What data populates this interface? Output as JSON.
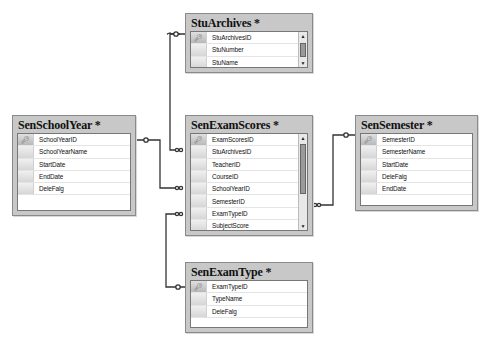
{
  "diagram": {
    "type": "database-relationship-diagram",
    "tables": [
      {
        "name": "StuArchives",
        "title": "StuArchives *",
        "columns": [
          {
            "name": "StuArchivesID",
            "primary_key": true
          },
          {
            "name": "StuNumber",
            "primary_key": false
          },
          {
            "name": "StuName",
            "primary_key": false
          }
        ],
        "has_scrollbar": true
      },
      {
        "name": "SenSchoolYear",
        "title": "SenSchoolYear *",
        "columns": [
          {
            "name": "SchoolYearID",
            "primary_key": true
          },
          {
            "name": "SchoolYearName",
            "primary_key": false
          },
          {
            "name": "StartDate",
            "primary_key": false
          },
          {
            "name": "EndDate",
            "primary_key": false
          },
          {
            "name": "DeleFalg",
            "primary_key": false
          }
        ],
        "has_scrollbar": false
      },
      {
        "name": "SenExamScores",
        "title": "SenExamScores *",
        "columns": [
          {
            "name": "ExamScoresID",
            "primary_key": true
          },
          {
            "name": "StuArchivesID",
            "primary_key": false
          },
          {
            "name": "TeacherID",
            "primary_key": false
          },
          {
            "name": "CourseID",
            "primary_key": false
          },
          {
            "name": "SchoolYearID",
            "primary_key": false
          },
          {
            "name": "SemesterID",
            "primary_key": false
          },
          {
            "name": "ExamTypeID",
            "primary_key": false
          },
          {
            "name": "SubjectScore",
            "primary_key": false
          }
        ],
        "has_scrollbar": true
      },
      {
        "name": "SenSemester",
        "title": "SenSemester *",
        "columns": [
          {
            "name": "SemesterID",
            "primary_key": true
          },
          {
            "name": "SemesterName",
            "primary_key": false
          },
          {
            "name": "StartDate",
            "primary_key": false
          },
          {
            "name": "DeleFalg",
            "primary_key": false
          },
          {
            "name": "EndDate",
            "primary_key": false
          }
        ],
        "has_scrollbar": false
      },
      {
        "name": "SenExamType",
        "title": "SenExamType *",
        "columns": [
          {
            "name": "ExamTypeID",
            "primary_key": true
          },
          {
            "name": "TypeName",
            "primary_key": false
          },
          {
            "name": "DeleFalg",
            "primary_key": false
          }
        ],
        "has_scrollbar": false
      }
    ],
    "relationships": [
      {
        "from": "StuArchives",
        "to": "SenExamScores",
        "one_side": "StuArchives",
        "many_side": "SenExamScores"
      },
      {
        "from": "SenSchoolYear",
        "to": "SenExamScores",
        "one_side": "SenSchoolYear",
        "many_side": "SenExamScores"
      },
      {
        "from": "SenSemester",
        "to": "SenExamScores",
        "one_side": "SenSemester",
        "many_side": "SenExamScores"
      },
      {
        "from": "SenExamType",
        "to": "SenExamScores",
        "one_side": "SenExamType",
        "many_side": "SenExamScores"
      }
    ]
  },
  "icons": {
    "key": "key-icon",
    "scroll_up": "▲",
    "scroll_down": "▼"
  },
  "colors": {
    "table_frame": "#c8c8c8",
    "table_body": "#ffffff",
    "line": "#333333"
  }
}
